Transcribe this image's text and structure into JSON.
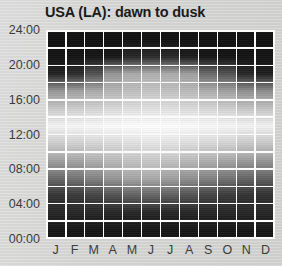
{
  "chart_data": {
    "type": "heatmap",
    "title": "USA (LA): dawn to dusk",
    "xlabel": "",
    "ylabel": "",
    "categories": [
      "J",
      "F",
      "M",
      "A",
      "M",
      "J",
      "J",
      "A",
      "S",
      "O",
      "N",
      "D"
    ],
    "month_names": [
      "January",
      "February",
      "March",
      "April",
      "May",
      "June",
      "July",
      "August",
      "September",
      "October",
      "November",
      "December"
    ],
    "y_ticks": [
      "00:00",
      "04:00",
      "08:00",
      "12:00",
      "16:00",
      "20:00",
      "24:00"
    ],
    "y_tick_values": [
      0,
      4,
      8,
      12,
      16,
      20,
      24
    ],
    "ylim": [
      0,
      24
    ],
    "row_bins": [
      "00:00-02:00",
      "02:00-04:00",
      "04:00-06:00",
      "06:00-08:00",
      "08:00-10:00",
      "10:00-12:00",
      "12:00-14:00",
      "14:00-16:00",
      "16:00-18:00",
      "18:00-20:00",
      "20:00-22:00",
      "22:00-24:00"
    ],
    "grid": true,
    "legend": "none",
    "colormap": "grayscale-light-intensity",
    "value_meaning": "daylight brightness 0 (night, black) to 100 (midday, white)",
    "dawn_times": [
      "06:55",
      "06:40",
      "06:15",
      "05:45",
      "05:25",
      "05:20",
      "05:35",
      "05:55",
      "06:15",
      "06:35",
      "06:05",
      "06:35"
    ],
    "dusk_times": [
      "17:45",
      "18:10",
      "18:30",
      "19:45",
      "20:00",
      "20:10",
      "20:10",
      "19:55",
      "19:20",
      "18:40",
      "17:55",
      "17:45"
    ],
    "values": [
      [
        5,
        5,
        5,
        5,
        5,
        5,
        5,
        5,
        5,
        5,
        5,
        5
      ],
      [
        12,
        12,
        12,
        12,
        12,
        12,
        12,
        12,
        12,
        12,
        12,
        12
      ],
      [
        18,
        20,
        24,
        30,
        36,
        38,
        35,
        30,
        24,
        20,
        17,
        16
      ],
      [
        40,
        44,
        50,
        58,
        64,
        66,
        62,
        56,
        50,
        44,
        38,
        36
      ],
      [
        62,
        64,
        68,
        72,
        76,
        78,
        76,
        72,
        68,
        64,
        60,
        58
      ],
      [
        80,
        82,
        84,
        86,
        88,
        90,
        89,
        87,
        85,
        83,
        79,
        78
      ],
      [
        96,
        97,
        98,
        99,
        100,
        100,
        100,
        99,
        98,
        97,
        96,
        95
      ],
      [
        78,
        80,
        82,
        85,
        87,
        88,
        88,
        86,
        84,
        81,
        77,
        76
      ],
      [
        58,
        62,
        66,
        70,
        74,
        76,
        75,
        72,
        67,
        62,
        55,
        54
      ],
      [
        10,
        14,
        30,
        58,
        66,
        68,
        67,
        62,
        40,
        30,
        12,
        9
      ],
      [
        4,
        4,
        5,
        6,
        12,
        14,
        13,
        8,
        5,
        4,
        4,
        4
      ],
      [
        3,
        3,
        3,
        3,
        3,
        3,
        3,
        3,
        3,
        3,
        3,
        3
      ]
    ],
    "series_note": "rows ordered bottom (00:00-02:00) to top (22:00-24:00)"
  }
}
